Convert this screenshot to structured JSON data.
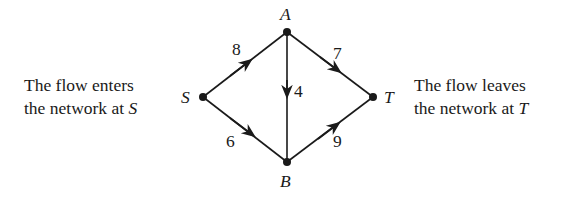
{
  "captions": {
    "left": {
      "line1": "The flow enters",
      "line2_prefix": "the network at ",
      "line2_var": "S"
    },
    "right": {
      "line1": "The flow leaves",
      "line2_prefix": "the network at ",
      "line2_var": "T"
    }
  },
  "nodes": [
    {
      "id": "S",
      "label": "S"
    },
    {
      "id": "A",
      "label": "A"
    },
    {
      "id": "B",
      "label": "B"
    },
    {
      "id": "T",
      "label": "T"
    }
  ],
  "edges": [
    {
      "from": "S",
      "to": "A",
      "weight": "8"
    },
    {
      "from": "S",
      "to": "B",
      "weight": "6"
    },
    {
      "from": "A",
      "to": "B",
      "weight": "4"
    },
    {
      "from": "A",
      "to": "T",
      "weight": "7"
    },
    {
      "from": "B",
      "to": "T",
      "weight": "9"
    }
  ]
}
